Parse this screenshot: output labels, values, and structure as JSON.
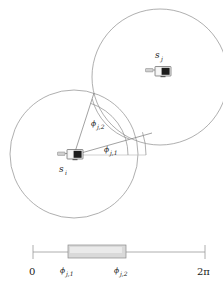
{
  "figure": {
    "name": "sensor-angular-coverage-interval",
    "caption": "",
    "background_color": "#ffffff",
    "line_color": "#8c8c8c",
    "interval_fill_color": "#d9d9d9"
  },
  "nodes": [
    {
      "id": "s_i",
      "label_base": "s",
      "label_sub": "i",
      "icon": "sensor-node-icon",
      "x": 74,
      "y": 155,
      "label_x": 59,
      "label_y": 172
    },
    {
      "id": "s_j",
      "label_base": "s",
      "label_sub": "j",
      "icon": "sensor-node-icon",
      "x": 161,
      "y": 72,
      "label_x": 155,
      "label_y": 58
    }
  ],
  "circles": [
    {
      "name": "coverage-circle-si",
      "cx": 74,
      "cy": 154,
      "r": 64
    },
    {
      "name": "coverage-circle-sj",
      "cx": 160,
      "cy": 77,
      "r": 68
    }
  ],
  "angles": [
    {
      "name": "phi-j-1",
      "base": "ϕ",
      "sub": "j,1",
      "display": "ϕ",
      "subscript": "j,1",
      "label_x": 107,
      "label_y": 156,
      "degrees": 16
    },
    {
      "name": "phi-j-2",
      "base": "ϕ",
      "sub": "j,2",
      "display": "ϕ",
      "subscript": "j,2",
      "label_x": 94,
      "label_y": 130,
      "degrees": 72
    }
  ],
  "scale": {
    "name": "angular-interval-scale",
    "axis_start_label": "0",
    "axis_end_label": "2π",
    "axis_x1": 33,
    "axis_x2": 205,
    "axis_y": 252,
    "interval_start_label": "ϕ",
    "interval_start_sub": "j,1",
    "interval_end_label": "ϕ",
    "interval_end_sub": "j,2",
    "interval_x1": 66,
    "interval_x2": 124,
    "tick_labels": [
      "0",
      "ϕ",
      "ϕ",
      "2π"
    ],
    "tick_sublabels": [
      "",
      "j,1",
      "j,2",
      ""
    ],
    "tick_x": [
      33,
      71,
      126,
      203
    ],
    "tick_label_y": 272
  },
  "chart_data": {
    "type": "diagram",
    "title": "",
    "xlabel": "",
    "ylabel": "",
    "annotations": [
      "s_i",
      "s_j",
      "ϕ_{j,1}",
      "ϕ_{j,2}",
      "0",
      "2π"
    ],
    "interval": {
      "start_symbol": "ϕ_{j,1}",
      "end_symbol": "ϕ_{j,2}",
      "axis_range": [
        "0",
        "2π"
      ],
      "start_fraction": 0.192,
      "end_fraction": 0.529
    }
  }
}
